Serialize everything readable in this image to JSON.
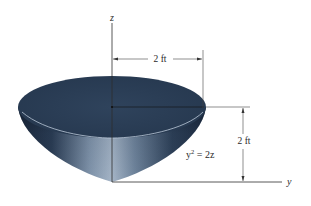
{
  "figure": {
    "axes": {
      "z_label": "z",
      "y_label": "y"
    },
    "dimensions": {
      "radius_label": "2 ft",
      "height_label": "2 ft"
    },
    "equation": {
      "base": "y",
      "exponent": "2",
      "rhs": " = 2z"
    },
    "colors": {
      "bowl_top": "#2c3f57",
      "bowl_side_dark": "#1f2e44",
      "bowl_side_light": "#8ea2b8",
      "rim_highlight": "#b8c6d6",
      "line": "#3a3a3a"
    }
  }
}
